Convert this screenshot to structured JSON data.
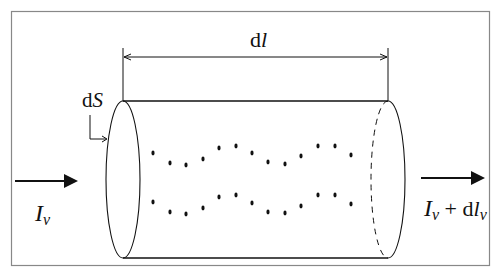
{
  "diagram": {
    "type": "cylinder-light-transport",
    "labels": {
      "length": {
        "base": "d",
        "italic": "l"
      },
      "area": {
        "base": "d",
        "italic": "S"
      },
      "incoming": {
        "italic": "I",
        "sub": "v"
      },
      "outgoing": {
        "italic": "I",
        "sub": "v",
        "plus": " + ",
        "d": "d",
        "italic2": "l",
        "sub2": "v"
      }
    },
    "colors": {
      "stroke": "#111111",
      "frame": "#888888",
      "background": "#ffffff"
    },
    "dots": {
      "top_row": [
        [
          153,
          153
        ],
        [
          170,
          163
        ],
        [
          186,
          165
        ],
        [
          203,
          159
        ],
        [
          219,
          148
        ],
        [
          236,
          146
        ],
        [
          252,
          153
        ],
        [
          268,
          162
        ],
        [
          285,
          164
        ],
        [
          301,
          156
        ],
        [
          318,
          146
        ],
        [
          335,
          146
        ],
        [
          351,
          155
        ]
      ],
      "bottom_row": [
        [
          153,
          202
        ],
        [
          170,
          212
        ],
        [
          186,
          214
        ],
        [
          203,
          208
        ],
        [
          219,
          197
        ],
        [
          236,
          195
        ],
        [
          252,
          203
        ],
        [
          268,
          212
        ],
        [
          285,
          213
        ],
        [
          301,
          206
        ],
        [
          318,
          195
        ],
        [
          335,
          195
        ],
        [
          351,
          204
        ]
      ]
    }
  }
}
